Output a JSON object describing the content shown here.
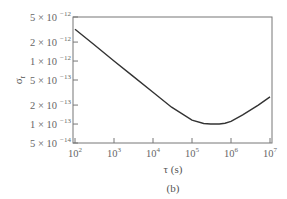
{
  "chart_data": {
    "type": "line",
    "title": "",
    "caption": "(b)",
    "xlabel": "τ (s)",
    "ylabel": "σr",
    "xscale": "log",
    "yscale": "log",
    "xlim": [
      100,
      10000000
    ],
    "ylim": [
      5e-14,
      5e-12
    ],
    "grid": false,
    "legend": null,
    "x_ticks": [
      {
        "value": 100,
        "base": "10",
        "exp": "2"
      },
      {
        "value": 1000,
        "base": "10",
        "exp": "3"
      },
      {
        "value": 10000,
        "base": "10",
        "exp": "4"
      },
      {
        "value": 100000,
        "base": "10",
        "exp": "5"
      },
      {
        "value": 1000000,
        "base": "10",
        "exp": "6"
      },
      {
        "value": 10000000,
        "base": "10",
        "exp": "7"
      }
    ],
    "y_ticks": [
      {
        "value": 5e-12,
        "mant": "5 × 10",
        "exp": "−12"
      },
      {
        "value": 2e-12,
        "mant": "2 × 10",
        "exp": "−12"
      },
      {
        "value": 1e-12,
        "mant": "1 × 10",
        "exp": "−12"
      },
      {
        "value": 5e-13,
        "mant": "5 × 10",
        "exp": "−13"
      },
      {
        "value": 2e-13,
        "mant": "2 × 10",
        "exp": "−13"
      },
      {
        "value": 1e-13,
        "mant": "1 × 10",
        "exp": "−13"
      },
      {
        "value": 5e-14,
        "mant": "5 × 10",
        "exp": "−14"
      }
    ],
    "series": [
      {
        "name": "σr(τ)",
        "color": "#333333",
        "x": [
          100,
          300,
          1000,
          3000,
          10000,
          30000,
          100000,
          200000,
          300000,
          500000,
          700000,
          1000000,
          2000000,
          5000000,
          10000000
        ],
        "y": [
          3.2e-12,
          1.85e-12,
          1e-12,
          5.8e-13,
          3.2e-13,
          1.85e-13,
          1.15e-13,
          1.02e-13,
          1e-13,
          1e-13,
          1.03e-13,
          1.1e-13,
          1.4e-13,
          2e-13,
          2.7e-13
        ]
      }
    ]
  }
}
